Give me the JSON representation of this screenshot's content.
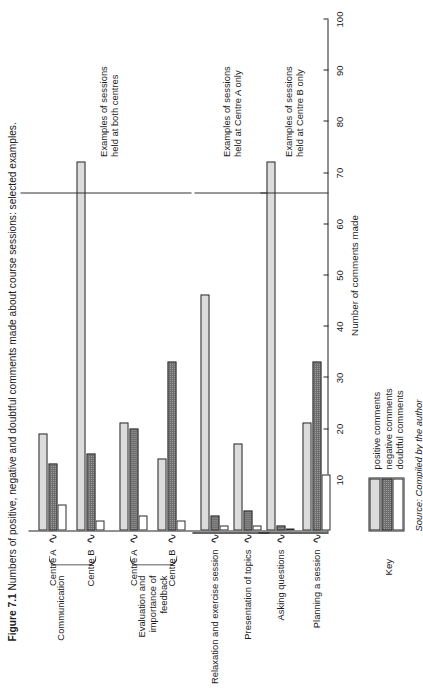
{
  "figure": {
    "number": "Figure 7.1",
    "caption": "Numbers of positive, negative and doubtful comments made about course sessions: selected examples.",
    "source": "Source: Compiled by the author"
  },
  "axis": {
    "x_title": "Number of comments made",
    "ticks": [
      "10",
      "20",
      "30",
      "40",
      "50",
      "60",
      "70",
      "80",
      "90",
      "100"
    ]
  },
  "key": {
    "title": "Key",
    "items": [
      {
        "label": "positive comments",
        "fill": "#dcdcdc"
      },
      {
        "label": "negative comments",
        "fill": "#9a9a9a"
      },
      {
        "label": "doubtful comments",
        "fill": "#ffffff"
      }
    ]
  },
  "sections": [
    {
      "note_line1": "Examples of sessions",
      "note_line2": "held at both centres"
    },
    {
      "note_line1": "Examples of sessions",
      "note_line2": "held at Centre A only"
    },
    {
      "note_line1": "Examples of sessions",
      "note_line2": "held at Centre B only"
    }
  ],
  "outer_groups": [
    {
      "label_line1": "Communication",
      "label_line2": "",
      "label_line3": ""
    },
    {
      "label_line1": "Evaluation and",
      "label_line2": "importance of",
      "label_line3": "feedback"
    }
  ],
  "categories": [
    "Centre A",
    "Centre B",
    "Centre A",
    "Centre B",
    "Relaxation and exercise session",
    "Presentation of topics",
    "Asking questions",
    "Planning a session"
  ],
  "chart_data": {
    "type": "bar",
    "orientation": "horizontal",
    "title": "Numbers of positive, negative and doubtful comments made about course sessions: selected examples.",
    "xlabel": "Number of comments made",
    "ylabel": "",
    "xlim": [
      0,
      100
    ],
    "grid": false,
    "legend_position": "bottom-left",
    "categories": [
      "Communication - Centre A",
      "Communication - Centre B",
      "Evaluation and importance of feedback - Centre A",
      "Evaluation and importance of feedback - Centre B",
      "Relaxation and exercise session",
      "Presentation of topics",
      "Asking questions",
      "Planning a session"
    ],
    "series": [
      {
        "name": "positive comments",
        "color": "#dcdcdc",
        "values": [
          19,
          72,
          21,
          14,
          46,
          17,
          72,
          21
        ]
      },
      {
        "name": "negative comments",
        "color": "#9a9a9a",
        "values": [
          13,
          15,
          20,
          33,
          3,
          4,
          1,
          33
        ]
      },
      {
        "name": "doubtful comments",
        "color": "#ffffff",
        "values": [
          5,
          2,
          3,
          2,
          1,
          1,
          0,
          11
        ]
      }
    ]
  }
}
